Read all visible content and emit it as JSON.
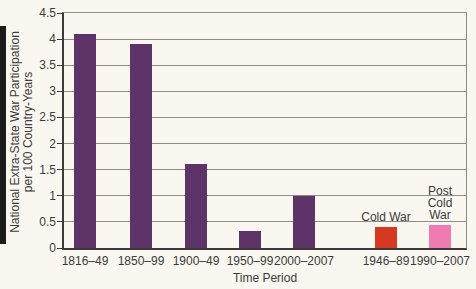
{
  "figure": {
    "background": "#f9f7f0",
    "left_rule_color": "#1c1c1c"
  },
  "chart_data": {
    "type": "bar",
    "title": "",
    "xlabel": "Time Period",
    "ylabel": "National Extra-State War Participation per 100 Country-Years",
    "ylabel_line1": "National Extra-State War Participation",
    "ylabel_line2": "per 100 Country-Years",
    "ylim": [
      0,
      4.5
    ],
    "grid": true,
    "legend": "none",
    "grid_color": "#8f8c86",
    "axis_color": "#3a3a3a",
    "text_color": "#3c3c3c",
    "bar_width_px": 22,
    "yticks": [
      {
        "value": 0,
        "label": "0"
      },
      {
        "value": 0.5,
        "label": "0.5"
      },
      {
        "value": 1,
        "label": "1"
      },
      {
        "value": 1.5,
        "label": "1.5"
      },
      {
        "value": 2,
        "label": "2"
      },
      {
        "value": 2.5,
        "label": "2.5"
      },
      {
        "value": 3,
        "label": "3"
      },
      {
        "value": 3.5,
        "label": "3.5"
      },
      {
        "value": 4,
        "label": "4"
      },
      {
        "value": 4.5,
        "label": "4.5"
      }
    ],
    "bars": [
      {
        "category": "1816–49",
        "value": 4.1,
        "color": "#5e3468",
        "x_center_px": 21
      },
      {
        "category": "1850–99",
        "value": 3.9,
        "color": "#5e3468",
        "x_center_px": 77
      },
      {
        "category": "1900–49",
        "value": 1.6,
        "color": "#5e3468",
        "x_center_px": 132
      },
      {
        "category": "1950–99",
        "value": 0.33,
        "color": "#5e3468",
        "x_center_px": 186
      },
      {
        "category": "2000–2007",
        "value": 1.0,
        "color": "#5e3468",
        "x_center_px": 240
      },
      {
        "category": "1946–89",
        "value": 0.4,
        "color": "#d6391f",
        "x_center_px": 322,
        "annotation": "Cold War"
      },
      {
        "category": "1990–2007",
        "value": 0.45,
        "color": "#ee7cb2",
        "x_center_px": 376,
        "annotation": "Post\nCold War"
      }
    ]
  }
}
